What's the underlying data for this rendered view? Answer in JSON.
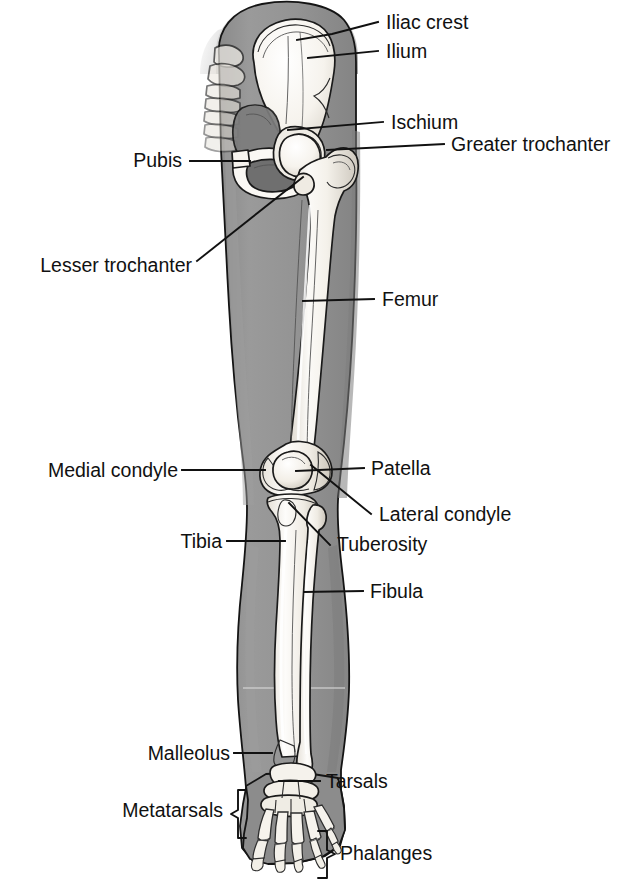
{
  "figure": {
    "view": "anterior",
    "colors": {
      "background": "#ffffff",
      "limb_silhouette": "#909090",
      "limb_silhouette_dark": "#7d7d7d",
      "bone_fill": "#f4f2ee",
      "bone_shadow": "#cfcac2",
      "outline": "#141414",
      "label_text": "#111111",
      "leader_line": "#111111"
    }
  },
  "labels": [
    {
      "id": "iliac-crest",
      "text": "Iliac crest",
      "side": "right",
      "text_x": 386,
      "text_y": 29,
      "leader": "M 297,40 L 332,34 L 378,22",
      "leader_type": "polyline"
    },
    {
      "id": "ilium",
      "text": "Ilium",
      "side": "right",
      "text_x": 386,
      "text_y": 58,
      "leader": "M 308,58 L 378,51",
      "leader_type": "line"
    },
    {
      "id": "ischium",
      "text": "Ischium",
      "side": "right",
      "text_x": 391,
      "text_y": 129,
      "leader": "M 288,130 L 383,122",
      "leader_type": "line"
    },
    {
      "id": "greater-trochanter",
      "text": "Greater trochanter",
      "side": "right",
      "text_x": 451,
      "text_y": 151,
      "leader": "M 327,150 L 444,144",
      "leader_type": "line"
    },
    {
      "id": "pubis",
      "text": "Pubis",
      "side": "left",
      "text_x": 182,
      "text_y": 167,
      "leader": "M 190,161 L 250,161",
      "leader_type": "line"
    },
    {
      "id": "lesser-trochanter",
      "text": "Lesser trochanter",
      "side": "left",
      "text_x": 192,
      "text_y": 272,
      "leader": "M 197,261 L 303,177",
      "leader_type": "line"
    },
    {
      "id": "femur",
      "text": "Femur",
      "side": "right",
      "text_x": 382,
      "text_y": 306,
      "leader": "M 303,301 L 374,299",
      "leader_type": "line"
    },
    {
      "id": "medial-condyle",
      "text": "Medial condyle",
      "side": "left",
      "text_x": 178,
      "text_y": 477,
      "leader": "M 182,470 L 265,470",
      "leader_type": "line"
    },
    {
      "id": "patella",
      "text": "Patella",
      "side": "right",
      "text_x": 371,
      "text_y": 475,
      "leader": "M 296,471 L 364,468",
      "leader_type": "line"
    },
    {
      "id": "lateral-condyle",
      "text": "Lateral condyle",
      "side": "right",
      "text_x": 379,
      "text_y": 521,
      "leader": "M 311,465 L 371,514",
      "leader_type": "line"
    },
    {
      "id": "tibia",
      "text": "Tibia",
      "side": "left",
      "text_x": 222,
      "text_y": 548,
      "leader": "M 227,541 L 285,541",
      "leader_type": "line"
    },
    {
      "id": "tuberosity",
      "text": "Tuberosity",
      "side": "right",
      "text_x": 337,
      "text_y": 551,
      "leader": "M 289,503 L 330,545",
      "leader_type": "line"
    },
    {
      "id": "fibula",
      "text": "Fibula",
      "side": "right",
      "text_x": 370,
      "text_y": 598,
      "leader": "M 304,592 L 363,591",
      "leader_type": "line"
    },
    {
      "id": "malleolus",
      "text": "Malleolus",
      "side": "left",
      "text_x": 230,
      "text_y": 760,
      "leader": "M 234,753 L 272,753",
      "leader_type": "line"
    },
    {
      "id": "tarsals",
      "text": "Tarsals",
      "side": "right",
      "text_x": 326,
      "text_y": 788,
      "leader": "M 279,781 L 320,781",
      "leader_type": "line"
    },
    {
      "id": "metatarsals",
      "text": "Metatarsals",
      "side": "left",
      "text_x": 223,
      "text_y": 817,
      "brace": "right-facing",
      "brace_x": 239,
      "brace_top": 790,
      "brace_bottom": 838,
      "brace_tip": 230
    },
    {
      "id": "phalanges",
      "text": "Phalanges",
      "side": "right",
      "text_x": 340,
      "text_y": 860,
      "brace": "left-facing",
      "brace_x": 327,
      "brace_top": 831,
      "brace_bottom": 878,
      "brace_tip": 336
    }
  ],
  "structures": [
    {
      "id": "pelvis",
      "name": "Pelvis (hip bone)"
    },
    {
      "id": "femur",
      "name": "Femur (thigh bone)"
    },
    {
      "id": "patella",
      "name": "Patella (kneecap)"
    },
    {
      "id": "tibia",
      "name": "Tibia (shin bone)"
    },
    {
      "id": "fibula",
      "name": "Fibula"
    },
    {
      "id": "tarsals",
      "name": "Tarsal bones"
    },
    {
      "id": "metatarsals",
      "name": "Metatarsal bones"
    },
    {
      "id": "phalanges",
      "name": "Phalanges (toe bones)"
    }
  ]
}
